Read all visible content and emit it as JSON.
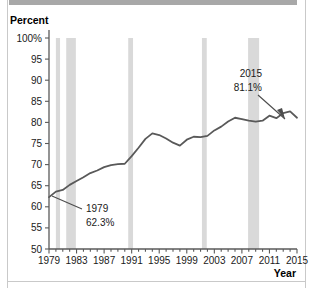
{
  "figure": {
    "background_color": "#ffffff",
    "frame_color": "#c9c9c9",
    "top_bar_color": "#a8a8a8"
  },
  "labels": {
    "y_axis_title": "Percent",
    "x_axis_title": "Year"
  },
  "annotations": [
    {
      "name": "start-annotation",
      "year_label": "1979",
      "value_label": "62.3%",
      "text_x": 86,
      "text_y": 212,
      "leader_from_x": 52,
      "leader_from_y": 196,
      "leader_to_x": 82,
      "leader_to_y": 209
    },
    {
      "name": "end-annotation",
      "year_label": "2015",
      "value_label": "81.1%",
      "text_x": 262,
      "text_y": 77,
      "leader_from_x": 258,
      "leader_from_y": 95,
      "leader_to_x": 285,
      "leader_to_y": 119
    }
  ],
  "chart_data": {
    "type": "line",
    "title": "",
    "xlabel": "Year",
    "ylabel": "Percent",
    "xlim": [
      1979,
      2015
    ],
    "ylim": [
      50,
      100
    ],
    "yticks": [
      50,
      55,
      60,
      65,
      70,
      75,
      80,
      85,
      90,
      95,
      100
    ],
    "ytick_labels": [
      "50",
      "55",
      "60",
      "65",
      "70",
      "75",
      "80",
      "85",
      "90",
      "95",
      "100%"
    ],
    "xticks": [
      1979,
      1983,
      1987,
      1991,
      1995,
      1999,
      2003,
      2007,
      2011,
      2015
    ],
    "xtick_labels": [
      "1979",
      "1983",
      "1987",
      "1991",
      "1995",
      "1999",
      "2003",
      "2007",
      "2011",
      "2015"
    ],
    "minor_xtick_interval": 1,
    "grid": false,
    "legend": "none",
    "line_color": "#595959",
    "line_width": 1.8,
    "x": [
      1979,
      1980,
      1981,
      1982,
      1983,
      1984,
      1985,
      1986,
      1987,
      1988,
      1989,
      1990,
      1991,
      1992,
      1993,
      1994,
      1995,
      1996,
      1997,
      1998,
      1999,
      2000,
      2001,
      2002,
      2003,
      2004,
      2005,
      2006,
      2007,
      2008,
      2009,
      2010,
      2011,
      2012,
      2013,
      2014,
      2015
    ],
    "values": [
      62.3,
      63.6,
      64.0,
      65.2,
      66.1,
      67.0,
      68.0,
      68.6,
      69.4,
      69.9,
      70.1,
      70.2,
      72.0,
      74.0,
      76.1,
      77.4,
      77.0,
      76.2,
      75.2,
      74.5,
      75.9,
      76.6,
      76.5,
      76.8,
      78.1,
      79.0,
      80.2,
      81.1,
      80.8,
      80.4,
      80.2,
      80.4,
      81.6,
      81.0,
      82.2,
      82.6,
      81.1
    ],
    "series_name": "Percent",
    "shaded_regions": {
      "name": "recession-bands",
      "color": "#d9d9d9",
      "spans": [
        [
          1980.0,
          1980.6
        ],
        [
          1981.5,
          1982.9
        ],
        [
          1990.5,
          1991.2
        ],
        [
          2001.2,
          2001.9
        ],
        [
          2007.9,
          2009.5
        ]
      ]
    }
  }
}
